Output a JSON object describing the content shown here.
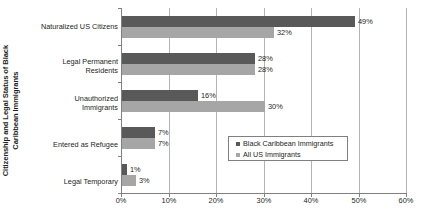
{
  "chart_data": {
    "type": "bar",
    "orientation": "horizontal",
    "title": "",
    "xlabel": "",
    "ylabel": "Citizenship and Legal Status of Black Caribbean Immigrants",
    "ylabel_lines": [
      "Citizenship and Legal Status of Black",
      "Caribbean Immigrants"
    ],
    "categories": [
      "Naturalized US Citizens",
      "Legal Permanent Residents",
      "Unauthorized Immigrants",
      "Entered as Refugee",
      "Legal Temporary"
    ],
    "category_lines": [
      [
        "Naturalized US Citizens"
      ],
      [
        "Legal Permanent",
        "Residents"
      ],
      [
        "Unauthorized",
        "Immigrants"
      ],
      [
        "Entered as Refugee"
      ],
      [
        "Legal Temporary"
      ]
    ],
    "series": [
      {
        "name": "Black Caribbean Immigrants",
        "color": "#595959",
        "values": [
          49,
          28,
          16,
          7,
          1
        ],
        "labels": [
          "49%",
          "28%",
          "16%",
          "7%",
          "1%"
        ]
      },
      {
        "name": "All US Immigrants",
        "color": "#a6a6a6",
        "values": [
          32,
          28,
          30,
          7,
          3
        ],
        "labels": [
          "32%",
          "28%",
          "30%",
          "7%",
          "3%"
        ]
      }
    ],
    "xlim": [
      0,
      60
    ],
    "xticks": [
      0,
      10,
      20,
      30,
      40,
      50,
      60
    ],
    "xtick_labels": [
      "0%",
      "10%",
      "20%",
      "30%",
      "40%",
      "50%",
      "60%"
    ],
    "grid": true,
    "grid_axis": "x",
    "legend_position": "center-right-inside"
  },
  "legend": {
    "entries": [
      {
        "label": "Black Caribbean Immigrants"
      },
      {
        "label": "All US Immigrants"
      }
    ]
  }
}
